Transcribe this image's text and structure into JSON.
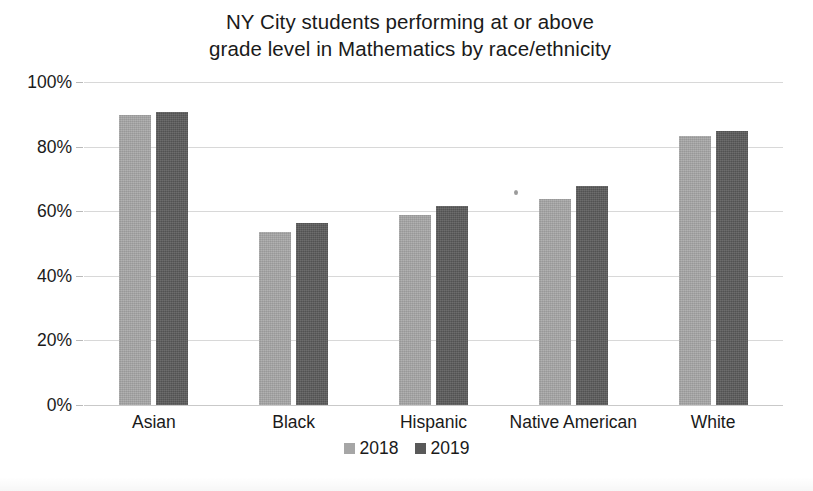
{
  "chart_data": {
    "type": "bar",
    "title": "NY City students performing at or above\ngrade level in Mathematics by race/ethnicity",
    "title_line1": "NY City students performing at or above",
    "title_line2": "grade level in Mathematics by race/ethnicity",
    "xlabel": "",
    "ylabel": "",
    "ylim": [
      0,
      100
    ],
    "yticks": [
      0,
      20,
      40,
      60,
      80,
      100
    ],
    "ytick_labels": [
      "0%",
      "20%",
      "40%",
      "60%",
      "80%",
      "100%"
    ],
    "grid": true,
    "legend_position": "bottom",
    "categories": [
      "Asian",
      "Black",
      "Hispanic",
      "Native American",
      "White"
    ],
    "series": [
      {
        "name": "2018",
        "color": "#a6a6a6",
        "values": [
          89.8,
          53.5,
          58.8,
          63.7,
          83.4
        ]
      },
      {
        "name": "2019",
        "color": "#595959",
        "values": [
          90.8,
          56.3,
          61.5,
          67.7,
          84.9
        ]
      }
    ]
  },
  "legend": {
    "entries": [
      {
        "label": "2018",
        "color": "#a6a6a6"
      },
      {
        "label": "2019",
        "color": "#595959"
      }
    ]
  },
  "colors": {
    "series_2018": "#a6a6a6",
    "series_2019": "#595959",
    "gridline": "#d8d8d8",
    "text": "#1a1a1a",
    "background": "#ffffff"
  }
}
